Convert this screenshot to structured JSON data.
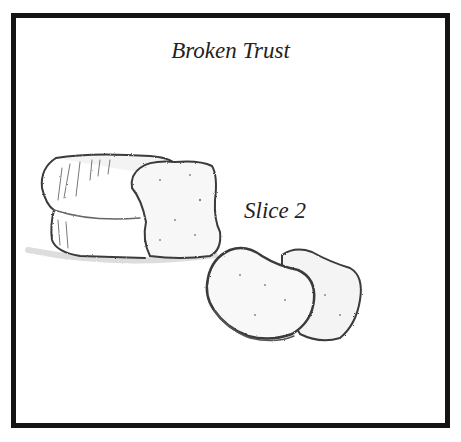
{
  "illustration": {
    "title": "Broken Trust",
    "label": "Slice 2",
    "subject": "pencil sketch of a bread loaf with one slice partly cut and two separate slices"
  },
  "caption": {
    "text": "",
    "note": "caption text is clipped at the bottom edge"
  }
}
